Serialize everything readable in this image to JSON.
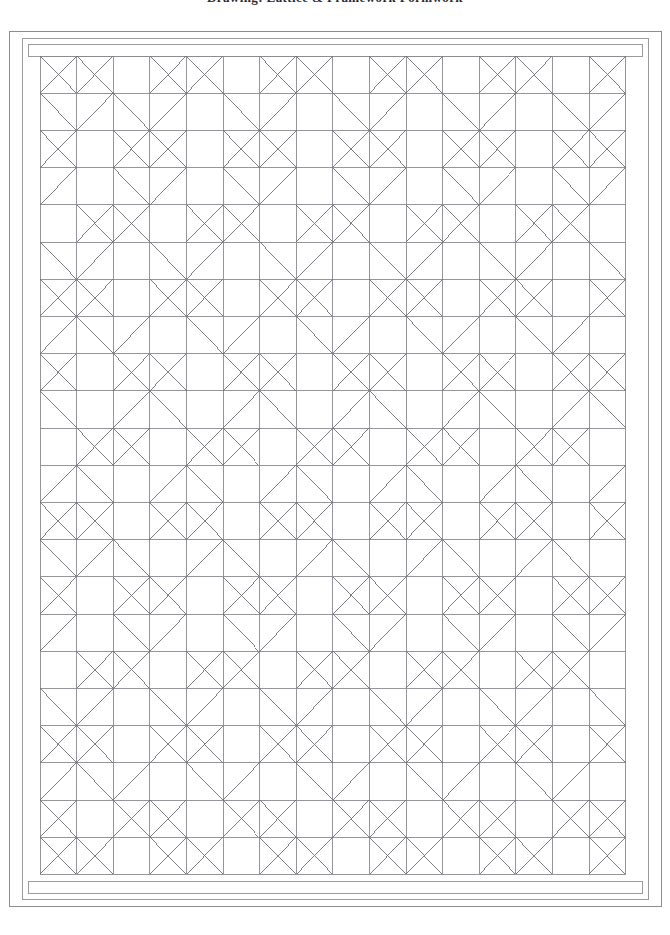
{
  "document": {
    "title": "Drawing: Lattice & Framework Formwork",
    "title_clipped": true,
    "sheet_background": "#ffffff"
  },
  "colors": {
    "outer_frame_line": "#8c8c93",
    "inner_frame_line": "#9a9aa0",
    "grid_line": "#8a8a90",
    "diagonal_line": "#6f6f77",
    "title_text": "#2b2b33",
    "paper": "#ffffff"
  },
  "frame": {
    "outer_rect": {
      "x": 9,
      "y": 31,
      "width": 652,
      "height": 875
    },
    "inner_rect": {
      "x": 22,
      "y": 38,
      "width": 626,
      "height": 861
    },
    "top_band": {
      "x": 28,
      "y": 44,
      "width": 614,
      "height": 12
    },
    "bottom_band": {
      "x": 28,
      "y": 881,
      "width": 614,
      "height": 12
    },
    "stroke_width": 1
  },
  "grid": {
    "origin_x": 40,
    "origin_y": 56,
    "cell_width": 36.6,
    "cell_height": 37.2,
    "columns": 16,
    "rows": 22,
    "line_width": 0.9,
    "diagonal_width": 0.9,
    "description": "Orthogonal lattice grid with selective cell diagonals forming a repeating woven motif"
  },
  "pattern": {
    "motif": "diagonal-cross-weave",
    "period_x": 3,
    "period_y": 3,
    "rule": "Cell (r,c) receives a full X when (c - r) mod 3 != 1 and (c + r) mod 3 != 1; single diagonals fill transitional cells",
    "full_cross_cells_label": "X",
    "half_diagonal_label": "/"
  },
  "chart_data": {
    "type": "table",
    "columns": 16,
    "rows": 22,
    "legend": [
      "0 = empty cell",
      "1 = forward diagonal",
      "2 = backward diagonal",
      "3 = full cross"
    ],
    "cells": [
      [
        3,
        3,
        0,
        3,
        3,
        0,
        3,
        3,
        0,
        3,
        3,
        0,
        3,
        3,
        0,
        3
      ],
      [
        2,
        1,
        2,
        1,
        0,
        2,
        1,
        0,
        2,
        1,
        0,
        2,
        1,
        0,
        2,
        1
      ],
      [
        3,
        0,
        3,
        3,
        0,
        3,
        3,
        0,
        3,
        3,
        0,
        3,
        3,
        0,
        3,
        3
      ],
      [
        1,
        0,
        2,
        1,
        0,
        2,
        1,
        0,
        2,
        1,
        0,
        2,
        1,
        0,
        2,
        1
      ],
      [
        0,
        3,
        3,
        0,
        3,
        3,
        0,
        3,
        3,
        0,
        3,
        3,
        0,
        3,
        3,
        0
      ],
      [
        2,
        1,
        0,
        2,
        1,
        0,
        2,
        1,
        0,
        2,
        1,
        0,
        2,
        1,
        0,
        2
      ],
      [
        3,
        3,
        0,
        3,
        3,
        0,
        3,
        3,
        0,
        3,
        3,
        0,
        3,
        3,
        0,
        3
      ],
      [
        1,
        2,
        1,
        0,
        2,
        1,
        0,
        2,
        1,
        0,
        2,
        1,
        0,
        2,
        1,
        0
      ],
      [
        3,
        0,
        3,
        3,
        0,
        3,
        3,
        0,
        3,
        3,
        0,
        3,
        3,
        0,
        3,
        3
      ],
      [
        2,
        0,
        1,
        2,
        0,
        1,
        2,
        0,
        1,
        2,
        0,
        1,
        2,
        0,
        1,
        2
      ],
      [
        0,
        3,
        3,
        0,
        3,
        3,
        0,
        3,
        3,
        0,
        3,
        3,
        0,
        3,
        3,
        0
      ],
      [
        1,
        2,
        0,
        1,
        2,
        0,
        1,
        2,
        0,
        1,
        2,
        0,
        1,
        2,
        0,
        1
      ],
      [
        3,
        3,
        0,
        3,
        3,
        0,
        3,
        3,
        0,
        3,
        3,
        0,
        3,
        3,
        0,
        3
      ],
      [
        2,
        1,
        2,
        0,
        1,
        2,
        0,
        1,
        2,
        0,
        1,
        2,
        0,
        1,
        2,
        0
      ],
      [
        3,
        0,
        3,
        3,
        0,
        3,
        3,
        0,
        3,
        3,
        0,
        3,
        3,
        0,
        3,
        3
      ],
      [
        1,
        0,
        2,
        1,
        0,
        2,
        1,
        0,
        2,
        1,
        0,
        2,
        1,
        0,
        2,
        1
      ],
      [
        0,
        3,
        3,
        0,
        3,
        3,
        0,
        3,
        3,
        0,
        3,
        3,
        0,
        3,
        3,
        0
      ],
      [
        2,
        1,
        0,
        2,
        1,
        0,
        2,
        1,
        0,
        2,
        1,
        0,
        2,
        1,
        0,
        2
      ],
      [
        3,
        3,
        0,
        3,
        3,
        0,
        3,
        3,
        0,
        3,
        3,
        0,
        3,
        3,
        0,
        3
      ],
      [
        1,
        2,
        1,
        0,
        2,
        1,
        0,
        2,
        1,
        0,
        2,
        1,
        0,
        2,
        1,
        0
      ],
      [
        3,
        0,
        3,
        3,
        0,
        3,
        3,
        0,
        3,
        3,
        0,
        3,
        3,
        0,
        3,
        3
      ],
      [
        3,
        3,
        0,
        3,
        3,
        0,
        3,
        3,
        0,
        3,
        3,
        0,
        3,
        3,
        0,
        3
      ]
    ]
  }
}
